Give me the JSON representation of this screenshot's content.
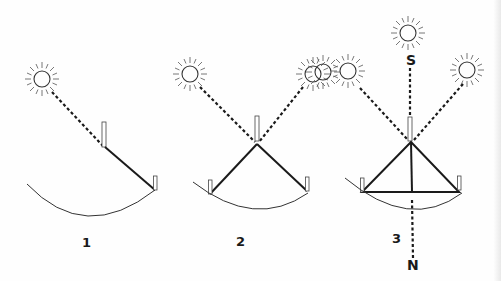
{
  "figure": {
    "panels": [
      {
        "id": "1",
        "label": "1",
        "suns": 1,
        "description": "Single sun ray through vertical gnomon to one peg on arc"
      },
      {
        "id": "2",
        "label": "2",
        "suns": 2,
        "description": "Two sun rays converge at gnomon, lines to two pegs on arc"
      },
      {
        "id": "3",
        "label": "3",
        "suns": 3,
        "description": "Three sun rays; triangle with south-north meridian line"
      }
    ],
    "compass": {
      "south": "S",
      "north": "N"
    },
    "colors": {
      "ink": "#1a1a1a",
      "background": "#fefefe"
    }
  }
}
